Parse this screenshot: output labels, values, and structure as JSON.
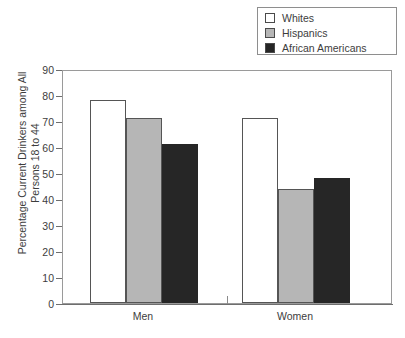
{
  "chart_data": {
    "type": "bar",
    "title": "",
    "xlabel": "",
    "ylabel": "Percentage Current Drinkers among All Persons 18 to 44",
    "ylabel_line1": "Percentage Current Drinkers among All",
    "ylabel_line2": "Persons 18 to 44",
    "categories": [
      "Men",
      "Women"
    ],
    "series": [
      {
        "name": "Whites",
        "values": [
          78,
          71
        ],
        "color": "#ffffff"
      },
      {
        "name": "Hispanics",
        "values": [
          71,
          44
        ],
        "color": "#b6b6b6"
      },
      {
        "name": "African Americans",
        "values": [
          61,
          48
        ],
        "color": "#262626"
      }
    ],
    "ylim": [
      0,
      90
    ],
    "ytick_step": 10,
    "yticks": [
      0,
      10,
      20,
      30,
      40,
      50,
      60,
      70,
      80,
      90
    ],
    "ytick_labels": [
      "0",
      "10",
      "20",
      "30",
      "40",
      "50",
      "60",
      "70",
      "80",
      "90"
    ],
    "grid": false,
    "legend_position": "top-right",
    "frame": true
  },
  "legend": {
    "items": [
      {
        "label": "Whites",
        "swatch": "#ffffff"
      },
      {
        "label": "Hispanics",
        "swatch": "#b6b6b6"
      },
      {
        "label": "African Americans",
        "swatch": "#262626"
      }
    ]
  }
}
